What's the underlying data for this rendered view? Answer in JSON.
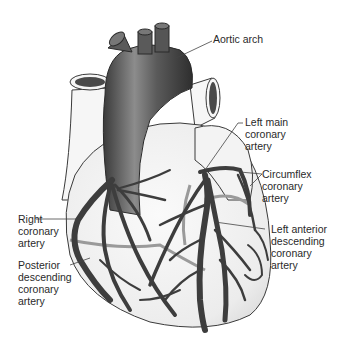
{
  "diagram": {
    "type": "anatomical-illustration",
    "colors": {
      "heart_fill": "#f2f2f2",
      "heart_outline": "#3a3a3a",
      "aorta_dark": "#3c3c3c",
      "aorta_light": "#8a8a8a",
      "artery": "#3d3d3d",
      "posterior_artery": "#9a9a9a",
      "label_text": "#2a2a2a",
      "leader_line": "#444444"
    }
  },
  "labels": {
    "aortic_arch": [
      "Aortic arch"
    ],
    "left_main": [
      "Left main",
      "coronary",
      "artery"
    ],
    "circumflex": [
      "Circumflex",
      "coronary",
      "artery"
    ],
    "right_coronary": [
      "Right",
      "coronary",
      "artery"
    ],
    "left_anterior": [
      "Left anterior",
      "descending",
      "coronary",
      "artery"
    ],
    "posterior_descending": [
      "Posterior",
      "descending",
      "coronary",
      "artery"
    ]
  }
}
